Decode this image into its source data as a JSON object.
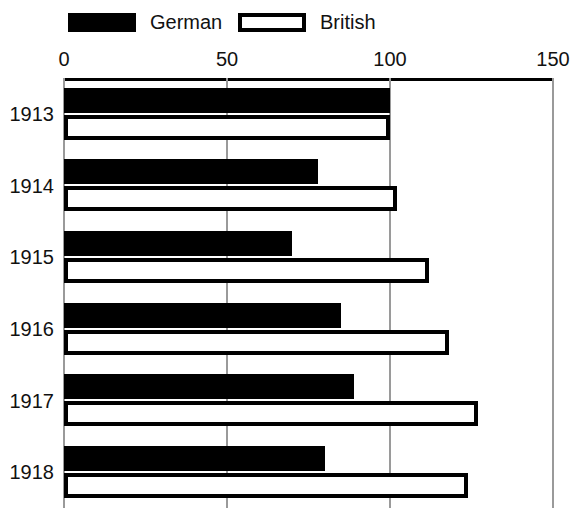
{
  "chart_data": {
    "type": "bar",
    "orientation": "horizontal",
    "title": "",
    "xlabel": "",
    "ylabel": "",
    "xlim": [
      0,
      150
    ],
    "xticks": [
      0,
      50,
      100,
      150
    ],
    "xtick_labels": [
      "0",
      "50",
      "100",
      "150"
    ],
    "grid": true,
    "legend_position": "top-left",
    "categories": [
      "1913",
      "1914",
      "1915",
      "1916",
      "1917",
      "1918"
    ],
    "series": [
      {
        "name": "German",
        "style": "filled",
        "color": "#000000",
        "values": [
          100,
          78,
          70,
          85,
          89,
          80
        ]
      },
      {
        "name": "British",
        "style": "outlined",
        "color": "#ffffff",
        "edge_color": "#000000",
        "values": [
          100,
          102,
          112,
          118,
          127,
          124
        ]
      }
    ]
  },
  "legend": {
    "entries": [
      {
        "label": "German",
        "swatch": "solid-black-swatch"
      },
      {
        "label": "British",
        "swatch": "hollow-outlined-swatch"
      }
    ]
  },
  "axis": {
    "ticks": [
      {
        "label": "0",
        "value": 0
      },
      {
        "label": "50",
        "value": 50
      },
      {
        "label": "100",
        "value": 100
      },
      {
        "label": "150",
        "value": 150
      }
    ]
  },
  "colors": {
    "german_fill": "#000000",
    "british_fill": "#ffffff",
    "outline": "#000000",
    "gridline": "#9a9a9a",
    "background": "#ffffff",
    "text": "#111111"
  }
}
